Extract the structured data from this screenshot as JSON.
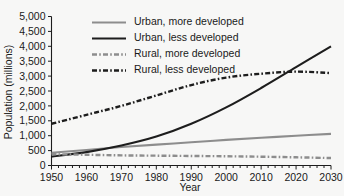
{
  "chart_data": {
    "type": "line",
    "title": "",
    "xlabel": "Year",
    "ylabel": "Population (millions)",
    "xlim": [
      1950,
      2030
    ],
    "ylim": [
      0,
      5000
    ],
    "xticks": [
      1950,
      1960,
      1970,
      1980,
      1990,
      2000,
      2010,
      2020,
      2030
    ],
    "xticklabels": [
      "1950",
      "1960",
      "1970",
      "1980",
      "1990",
      "2000",
      "2010",
      "2020",
      "2030"
    ],
    "yticks": [
      0,
      500,
      1000,
      1500,
      2000,
      2500,
      3000,
      3500,
      4000,
      4500,
      5000
    ],
    "yticklabels": [
      "0",
      "500",
      "1,000",
      "1,500",
      "2,000",
      "2,500",
      "3,000",
      "3,500",
      "4,000",
      "4,500",
      "5,000"
    ],
    "grid": false,
    "legend_position": "upper-center",
    "x": [
      1950,
      1960,
      1970,
      1980,
      1990,
      2000,
      2010,
      2020,
      2030
    ],
    "series": [
      {
        "name": "Urban, more developed",
        "style": "solid",
        "color": "#8d8d8d",
        "values": [
          430,
          520,
          620,
          700,
          780,
          860,
          930,
          1000,
          1060
        ]
      },
      {
        "name": "Urban, less developed",
        "style": "solid",
        "color": "#1d1d1d",
        "values": [
          300,
          450,
          670,
          970,
          1400,
          1950,
          2600,
          3300,
          4000
        ]
      },
      {
        "name": "Rural, more developed",
        "style": "dash-dot",
        "color": "#8d8d8d",
        "values": [
          380,
          360,
          340,
          330,
          320,
          310,
          295,
          275,
          250
        ]
      },
      {
        "name": "Rural, less developed",
        "style": "dash-dot",
        "color": "#1d1d1d",
        "values": [
          1400,
          1700,
          2000,
          2350,
          2700,
          2950,
          3080,
          3150,
          3100
        ]
      }
    ],
    "annotations": []
  },
  "legend": {
    "items": [
      {
        "label": "Urban, more developed"
      },
      {
        "label": "Urban, less developed"
      },
      {
        "label": "Rural, more developed"
      },
      {
        "label": "Rural, less developed"
      }
    ]
  }
}
